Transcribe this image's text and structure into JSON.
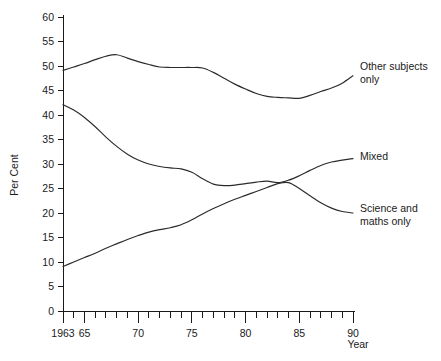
{
  "chart_data": {
    "type": "line",
    "title": "",
    "xlabel": "Year",
    "ylabel": "Per Cent",
    "xlim": [
      1963,
      1990
    ],
    "ylim": [
      0,
      60
    ],
    "grid": false,
    "legend_position": "right-inline-labels",
    "x": [
      1963,
      1964,
      1965,
      1966,
      1967,
      1968,
      1969,
      1970,
      1971,
      1972,
      1973,
      1974,
      1975,
      1976,
      1977,
      1978,
      1979,
      1980,
      1981,
      1982,
      1983,
      1984,
      1985,
      1986,
      1987,
      1988,
      1989,
      1990
    ],
    "x_tick_values": [
      1963,
      1965,
      1970,
      1975,
      1980,
      1985,
      1990
    ],
    "x_tick_labels": [
      "1963",
      "65",
      "70",
      "75",
      "80",
      "85",
      "90"
    ],
    "y_tick_values": [
      0,
      5,
      10,
      15,
      20,
      25,
      30,
      35,
      40,
      45,
      50,
      55,
      60
    ],
    "y_tick_labels": [
      "0",
      "5",
      "10",
      "15",
      "20",
      "25",
      "30",
      "35",
      "40",
      "45",
      "50",
      "55",
      "60"
    ],
    "series": [
      {
        "name": "Other subjects only",
        "label_lines": [
          "Other subjects",
          "only"
        ],
        "color": "#2b2b2b",
        "values": [
          49.1,
          49.8,
          50.5,
          51.3,
          52.0,
          52.3,
          51.6,
          50.9,
          50.3,
          49.8,
          49.7,
          49.7,
          49.7,
          49.6,
          48.7,
          47.5,
          46.3,
          45.3,
          44.4,
          43.8,
          43.6,
          43.5,
          43.4,
          44.0,
          44.8,
          45.5,
          46.5,
          48.0
        ]
      },
      {
        "name": "Mixed",
        "label_lines": [
          "Mixed"
        ],
        "color": "#2b2b2b",
        "values": [
          42.1,
          41.0,
          39.5,
          37.6,
          35.5,
          33.6,
          32.0,
          30.8,
          30.0,
          29.5,
          29.2,
          29.0,
          28.3,
          27.0,
          25.9,
          25.6,
          25.7,
          26.0,
          26.3,
          26.5,
          26.2,
          26.7,
          27.6,
          28.7,
          29.7,
          30.4,
          30.8,
          31.1
        ]
      },
      {
        "name": "Science and maths only",
        "label_lines": [
          "Science and",
          "maths only"
        ],
        "color": "#2b2b2b",
        "values": [
          9.1,
          10.0,
          10.9,
          11.8,
          12.8,
          13.7,
          14.6,
          15.4,
          16.1,
          16.6,
          17.0,
          17.6,
          18.6,
          19.8,
          20.9,
          21.9,
          22.8,
          23.6,
          24.4,
          25.2,
          26.0,
          26.2,
          25.0,
          23.5,
          22.1,
          21.0,
          20.3,
          20.0
        ]
      }
    ]
  }
}
